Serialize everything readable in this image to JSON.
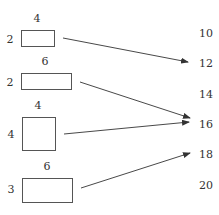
{
  "shapes": [
    {
      "id": "rect-1",
      "width_label": "4",
      "height_label": "2",
      "x": 21,
      "y": 30,
      "w": 33,
      "h": 16,
      "arrow_from": [
        63,
        38
      ],
      "arrow_to": [
        188,
        62
      ],
      "maps_to": "12"
    },
    {
      "id": "rect-2",
      "width_label": "6",
      "height_label": "2",
      "x": 21,
      "y": 73,
      "w": 50,
      "h": 16,
      "arrow_from": [
        80,
        82
      ],
      "arrow_to": [
        190,
        118
      ],
      "maps_to": "16"
    },
    {
      "id": "rect-3",
      "width_label": "4",
      "height_label": "4",
      "x": 22,
      "y": 117,
      "w": 33,
      "h": 33,
      "arrow_from": [
        64,
        134
      ],
      "arrow_to": [
        189,
        122
      ],
      "maps_to": "16"
    },
    {
      "id": "rect-4",
      "width_label": "6",
      "height_label": "3",
      "x": 22,
      "y": 178,
      "w": 50,
      "h": 24,
      "arrow_from": [
        81,
        188
      ],
      "arrow_to": [
        190,
        153
      ],
      "maps_to": "18"
    }
  ],
  "codomain": [
    {
      "label": "10",
      "y": 33
    },
    {
      "label": "12",
      "y": 63
    },
    {
      "label": "14",
      "y": 94
    },
    {
      "label": "16",
      "y": 124
    },
    {
      "label": "18",
      "y": 154
    },
    {
      "label": "20",
      "y": 185
    }
  ],
  "colors": {
    "stroke": "#555555",
    "text": "#333333",
    "background": "#ffffff"
  }
}
